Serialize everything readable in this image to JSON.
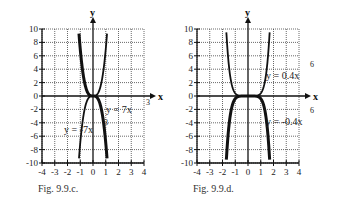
{
  "chart_data": [
    {
      "type": "line",
      "caption": "Fig. 9.9.c.",
      "xlabel": "x",
      "ylabel": "y",
      "xlim": [
        -4,
        4
      ],
      "ylim": [
        -10,
        10
      ],
      "x_ticks": [
        -4,
        -3,
        -2,
        -1,
        0,
        1,
        2,
        3,
        4
      ],
      "y_ticks": [
        -10,
        -8,
        -6,
        -4,
        -2,
        0,
        2,
        4,
        6,
        8,
        10
      ],
      "grid": true,
      "series": [
        {
          "name": "y = 7x^3",
          "label_main": "y = 7x",
          "label_exp": "3",
          "coef": 7,
          "power": 3,
          "x_range": [
            -1.1,
            1.1
          ],
          "bold": false
        },
        {
          "name": "y = -7x^3",
          "label_main": "y = -7x",
          "label_exp": "3",
          "coef": -7,
          "power": 3,
          "x_range": [
            -1.1,
            1.1
          ],
          "bold": true
        }
      ]
    },
    {
      "type": "line",
      "caption": "Fig. 9.9.d.",
      "xlabel": "x",
      "ylabel": "y",
      "xlim": [
        -4,
        4
      ],
      "ylim": [
        -10,
        10
      ],
      "x_ticks": [
        -4,
        -3,
        -2,
        -1,
        0,
        1,
        2,
        3,
        4
      ],
      "y_ticks": [
        -10,
        -8,
        -6,
        -4,
        -2,
        0,
        2,
        4,
        6,
        8,
        10
      ],
      "grid": true,
      "series": [
        {
          "name": "y = 0.4x^6",
          "label_main": "y = 0.4x",
          "label_exp": "6",
          "coef": 0.4,
          "power": 6,
          "x_range": [
            -1.7,
            1.7
          ],
          "bold": false
        },
        {
          "name": "y = -0.4x^6",
          "label_main": "y = -0.4x",
          "label_exp": "6",
          "coef": -0.4,
          "power": 6,
          "x_range": [
            -1.7,
            1.7
          ],
          "bold": true
        }
      ]
    }
  ]
}
